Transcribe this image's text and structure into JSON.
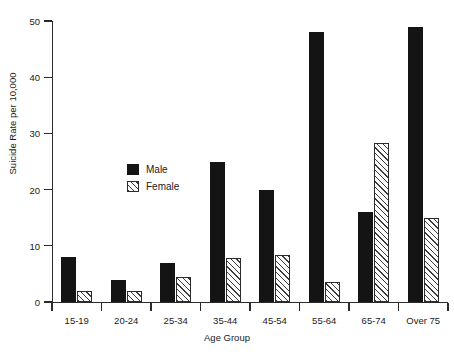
{
  "chart_data": {
    "type": "bar",
    "title": "",
    "xlabel": "Age Group",
    "ylabel": "Suicide Rate per 10,000",
    "categories": [
      "15-19",
      "20-24",
      "25-34",
      "35-44",
      "45-54",
      "55-64",
      "65-74",
      "Over 75"
    ],
    "series": [
      {
        "name": "Male",
        "color": "#141414",
        "fill": "solid",
        "values": [
          8,
          4,
          7,
          25,
          20,
          48,
          16,
          49
        ]
      },
      {
        "name": "Female",
        "color": "#3a3a3a",
        "fill": "diagonal-hatch",
        "values": [
          2,
          2,
          4.5,
          7.8,
          8.3,
          3.5,
          28.3,
          15
        ]
      }
    ],
    "ylim": [
      0,
      50
    ],
    "yticks": [
      0,
      10,
      20,
      30,
      40,
      50
    ],
    "ytick_labels": [
      "0",
      "10",
      "20",
      "30",
      "40",
      "50"
    ],
    "grid": false,
    "legend_position": "inside-left-middle",
    "legend_entries": [
      "Male",
      "Female"
    ]
  },
  "axes": {
    "y_label": "Suicide Rate per 10,000",
    "x_label": "Age Group"
  },
  "artifact": {
    "top_fragment": ""
  }
}
